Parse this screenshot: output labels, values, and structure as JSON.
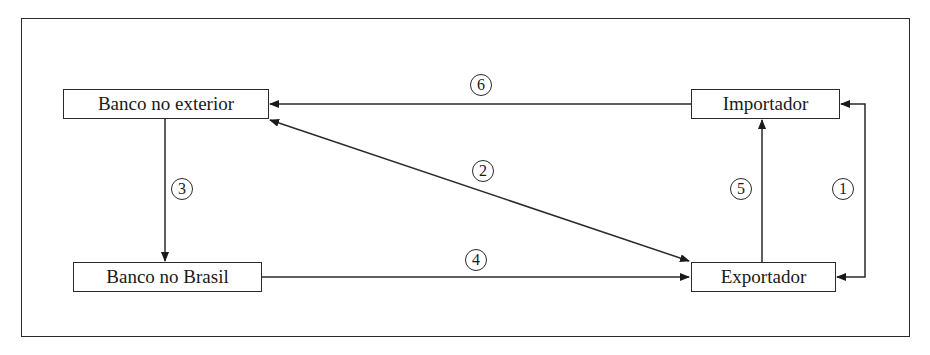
{
  "diagram": {
    "nodes": [
      {
        "id": "banco-exterior",
        "label": "Banco no exterior"
      },
      {
        "id": "importador",
        "label": "Importador"
      },
      {
        "id": "banco-brasil",
        "label": "Banco no Brasil"
      },
      {
        "id": "exportador",
        "label": "Exportador"
      }
    ],
    "edges": [
      {
        "step": "1",
        "from": "importador",
        "to": "exportador",
        "bidirectional": true
      },
      {
        "step": "2",
        "from": "banco-exterior",
        "to": "exportador",
        "bidirectional": true
      },
      {
        "step": "3",
        "from": "banco-exterior",
        "to": "banco-brasil",
        "bidirectional": false
      },
      {
        "step": "4",
        "from": "banco-brasil",
        "to": "exportador",
        "bidirectional": false
      },
      {
        "step": "5",
        "from": "exportador",
        "to": "importador",
        "bidirectional": false
      },
      {
        "step": "6",
        "from": "importador",
        "to": "banco-exterior",
        "bidirectional": false
      }
    ],
    "line_color": "#2a2a2a"
  }
}
